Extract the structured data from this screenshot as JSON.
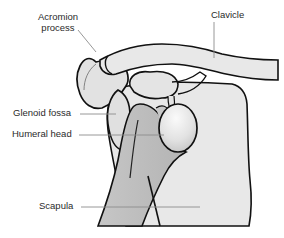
{
  "figure": {
    "labels": {
      "acromion_line1": "Acromion",
      "acromion_line2": "process",
      "clavicle": "Clavicle",
      "glenoid_fossa": "Glenoid fossa",
      "humeral_head": "Humeral head",
      "scapula": "Scapula"
    },
    "colors": {
      "bone_light": "#e6e6e6",
      "bone_mid": "#d4d4d4",
      "humerus_shaft": "#bdbdbd",
      "humeral_head_highlight": "#f4f4f4",
      "outline": "#111111",
      "leader_line": "#8c8c8c",
      "label_text": "#2a2a2a",
      "background": "#ffffff"
    }
  }
}
